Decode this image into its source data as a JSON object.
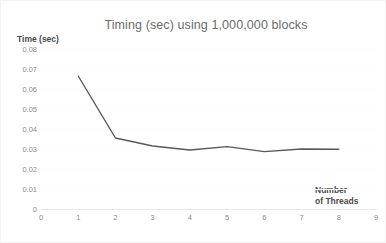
{
  "chart_data": {
    "type": "line",
    "title": "Timing (sec) using 1,000,000 blocks",
    "xlabel": "Number of Threads",
    "xlabel_lines": [
      "Number",
      "of Threads"
    ],
    "ylabel": "Time (sec)",
    "x": [
      1,
      2,
      3,
      4,
      5,
      6,
      7,
      8
    ],
    "values": [
      0.0665,
      0.0355,
      0.0315,
      0.0295,
      0.0312,
      0.0287,
      0.03,
      0.0299
    ],
    "series": [
      {
        "name": "Timing (sec)",
        "values": [
          0.0665,
          0.0355,
          0.0315,
          0.0295,
          0.0312,
          0.0287,
          0.03,
          0.0299
        ]
      }
    ],
    "xlim": [
      0,
      9
    ],
    "ylim": [
      0,
      0.08
    ],
    "xticks": [
      "0",
      "1",
      "2",
      "3",
      "4",
      "5",
      "6",
      "7",
      "8",
      "9"
    ],
    "yticks": [
      "0.08",
      "0.07",
      "0.06",
      "0.05",
      "0.04",
      "0.03",
      "0.02",
      "0.01",
      "0"
    ],
    "ytick_values": [
      0.08,
      0.07,
      0.06,
      0.05,
      0.04,
      0.03,
      0.02,
      0.01,
      0
    ],
    "grid": true,
    "legend": false,
    "line_color": "#595959",
    "grid_color": "#fbfbfb",
    "axis_color": "#e8e8e8",
    "tick_label_color": "#8a8a8a",
    "title_color": "#6b6b6b",
    "axis_title_color": "#4a4a4a"
  }
}
